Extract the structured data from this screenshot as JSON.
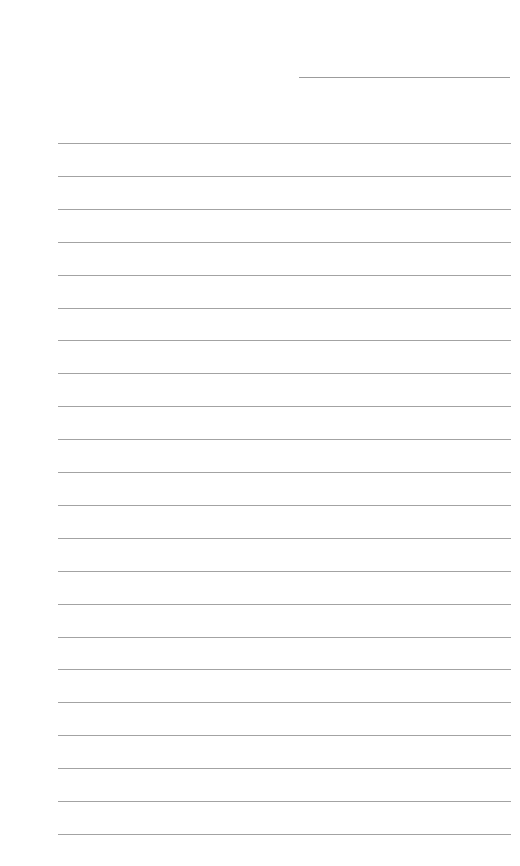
{
  "document": {
    "type": "blank lined paper",
    "header_line": {
      "present": true,
      "label": ""
    },
    "rules": {
      "count": 22,
      "first_y": 143,
      "spacing": 32.9,
      "left": 58,
      "width": 453,
      "color": "#a3a3a3"
    },
    "lines_text": [
      "",
      "",
      "",
      "",
      "",
      "",
      "",
      "",
      "",
      "",
      "",
      "",
      "",
      "",
      "",
      "",
      "",
      "",
      "",
      "",
      "",
      ""
    ]
  }
}
